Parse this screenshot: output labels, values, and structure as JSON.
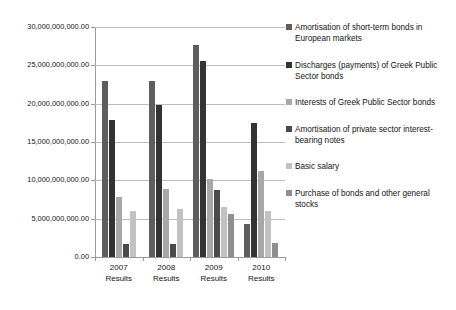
{
  "chart_data": {
    "type": "bar",
    "title": "",
    "xlabel": "",
    "ylabel": "",
    "ylim": [
      0,
      30000000000
    ],
    "grid": true,
    "legend_position": "right",
    "categories": [
      "2007 Results",
      "2008 Results",
      "2009 Results",
      "2010 Results"
    ],
    "category_lines": [
      [
        "2007",
        "Results"
      ],
      [
        "2008",
        "Results"
      ],
      [
        "2009",
        "Results"
      ],
      [
        "2010",
        "Results"
      ]
    ],
    "ytick_labels": [
      "0.00",
      "5,000,000,000.00",
      "10,000,000,000.00",
      "15,000,000,000.00",
      "20,000,000,000.00",
      "25,000,000,000.00",
      "30,000,000,000.00"
    ],
    "ytick_values": [
      0,
      5000000000,
      10000000000,
      15000000000,
      20000000000,
      25000000000,
      30000000000
    ],
    "series": [
      {
        "name": "Amortisation of short-term bonds in European markets",
        "color": "#5e5e5e",
        "values": [
          22900000000,
          23000000000,
          27600000000,
          4300000000
        ]
      },
      {
        "name": "Discharges (payments) of Greek Public Sector bonds",
        "color": "#333333",
        "values": [
          17900000000,
          19800000000,
          25600000000,
          17500000000
        ]
      },
      {
        "name": "Interests of Greek Public Sector bonds",
        "color": "#a8a8a8",
        "values": [
          7800000000,
          8900000000,
          10200000000,
          11200000000
        ]
      },
      {
        "name": "Amortisation of private sector interest-bearing notes",
        "color": "#4a4a4a",
        "values": [
          1700000000,
          1700000000,
          8800000000,
          0
        ]
      },
      {
        "name": "Basic salary",
        "color": "#c2c2c2",
        "values": [
          6000000000,
          6300000000,
          6500000000,
          5950000000
        ]
      },
      {
        "name": "Purchase of bonds and other general stocks",
        "color": "#8f8f8f",
        "values": [
          0,
          0,
          5600000000,
          1800000000
        ]
      }
    ]
  },
  "legend": {
    "items": [
      {
        "label": "Amortisation of short-term bonds in European markets",
        "color": "#5e5e5e"
      },
      {
        "label": "Discharges (payments) of Greek Public Sector bonds",
        "color": "#333333"
      },
      {
        "label": "Interests of Greek Public Sector bonds",
        "color": "#a8a8a8"
      },
      {
        "label": "Amortisation of private sector interest-bearing notes",
        "color": "#4a4a4a"
      },
      {
        "label": "Basic salary",
        "color": "#c2c2c2"
      },
      {
        "label": "Purchase of bonds and other general stocks",
        "color": "#8f8f8f"
      }
    ]
  }
}
